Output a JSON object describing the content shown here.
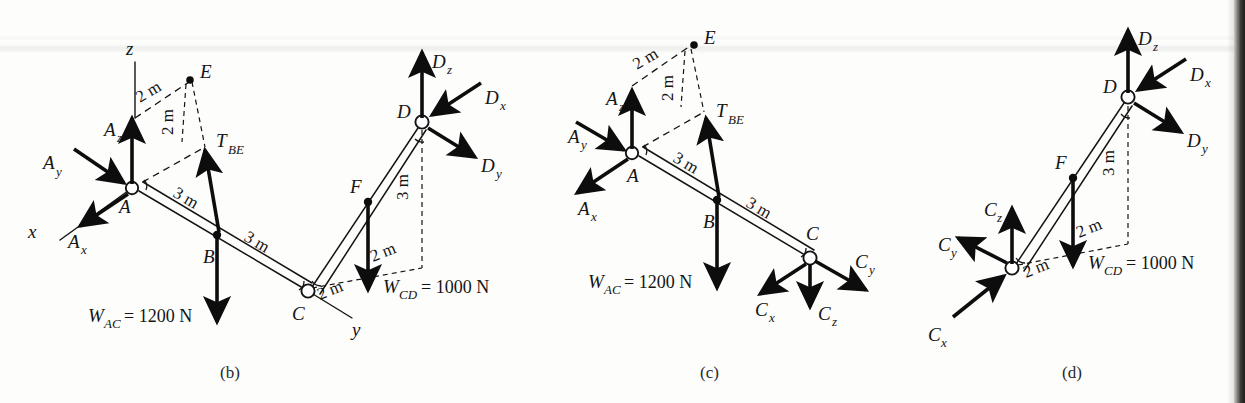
{
  "figure": {
    "kind": "free-body-diagram-set",
    "panels": [
      {
        "caption": "(b)",
        "axes": [
          {
            "name": "z",
            "label": "z"
          },
          {
            "name": "x",
            "label": "x"
          },
          {
            "name": "y",
            "label": "y"
          }
        ],
        "joints": [
          {
            "label": "A",
            "type": "pin"
          },
          {
            "label": "B",
            "type": "point"
          },
          {
            "label": "C",
            "type": "pin"
          },
          {
            "label": "D",
            "type": "pin"
          },
          {
            "label": "E",
            "type": "point"
          },
          {
            "label": "F",
            "type": "point"
          }
        ],
        "forces": [
          {
            "label": "A",
            "sub": "z",
            "dir": "up"
          },
          {
            "label": "A",
            "sub": "y",
            "dir": "down-right-into-A"
          },
          {
            "label": "A",
            "sub": "x",
            "dir": "down-left-away"
          },
          {
            "label": "T",
            "sub": "BE",
            "dir": "up"
          },
          {
            "label": "D",
            "sub": "z",
            "dir": "up"
          },
          {
            "label": "D",
            "sub": "x",
            "dir": "down-left-into-D"
          },
          {
            "label": "D",
            "sub": "y",
            "dir": "down-right-away"
          }
        ],
        "loads": [
          {
            "text": "W",
            "sub": "AC",
            "eq": " = 1200 N"
          },
          {
            "text": "W",
            "sub": "CD",
            "eq": " = 1000 N"
          }
        ],
        "dimensions": [
          "2 m",
          "2 m",
          "3 m",
          "3 m",
          "3 m",
          "2 m",
          "2 m"
        ]
      },
      {
        "caption": "(c)",
        "axes": [],
        "joints": [
          {
            "label": "A",
            "type": "pin"
          },
          {
            "label": "B",
            "type": "point"
          },
          {
            "label": "C",
            "type": "pin"
          },
          {
            "label": "E",
            "type": "point"
          }
        ],
        "forces": [
          {
            "label": "A",
            "sub": "z",
            "dir": "up"
          },
          {
            "label": "A",
            "sub": "y",
            "dir": "down-right-into-A"
          },
          {
            "label": "A",
            "sub": "x",
            "dir": "down-left-away"
          },
          {
            "label": "T",
            "sub": "BE",
            "dir": "up"
          },
          {
            "label": "C",
            "sub": "x",
            "dir": "down-left-away"
          },
          {
            "label": "C",
            "sub": "z",
            "dir": "down"
          },
          {
            "label": "C",
            "sub": "y",
            "dir": "down-right-away"
          }
        ],
        "loads": [
          {
            "text": "W",
            "sub": "AC",
            "eq": " = 1200 N"
          }
        ],
        "dimensions": [
          "2 m",
          "2 m",
          "3 m",
          "3 m"
        ]
      },
      {
        "caption": "(d)",
        "axes": [],
        "joints": [
          {
            "label": "C",
            "type": "pin"
          },
          {
            "label": "D",
            "type": "pin"
          },
          {
            "label": "F",
            "type": "point"
          }
        ],
        "forces": [
          {
            "label": "D",
            "sub": "z",
            "dir": "up"
          },
          {
            "label": "D",
            "sub": "x",
            "dir": "down-left-into-D"
          },
          {
            "label": "D",
            "sub": "y",
            "dir": "down-right-away"
          },
          {
            "label": "C",
            "sub": "z",
            "dir": "up"
          },
          {
            "label": "C",
            "sub": "y",
            "dir": "up-left-away"
          },
          {
            "label": "C",
            "sub": "x",
            "dir": "up-right-into-C"
          }
        ],
        "loads": [
          {
            "text": "W",
            "sub": "CD",
            "eq": " = 1000 N"
          }
        ],
        "dimensions": [
          "3 m",
          "2 m",
          "2 m"
        ]
      }
    ]
  },
  "labels": {
    "A": "A",
    "B": "B",
    "C": "C",
    "D": "D",
    "E": "E",
    "F": "F",
    "x": "x",
    "y": "y",
    "z": "z",
    "sub_x": "x",
    "sub_y": "y",
    "sub_z": "z",
    "sub_BE": "BE",
    "sub_AC": "AC",
    "sub_CD": "CD",
    "T": "T",
    "W": "W",
    "d2m": "2 m",
    "d3m": "3 m",
    "eq1200": " = 1200 N",
    "eq1000": " = 1000 N",
    "cap_b": "(b)",
    "cap_c": "(c)",
    "cap_d": "(d)"
  },
  "colors": {
    "ink": "#141414",
    "force": "#0d0d0d",
    "paper": "#fdfdfc",
    "page_edge": "#211f1d"
  }
}
